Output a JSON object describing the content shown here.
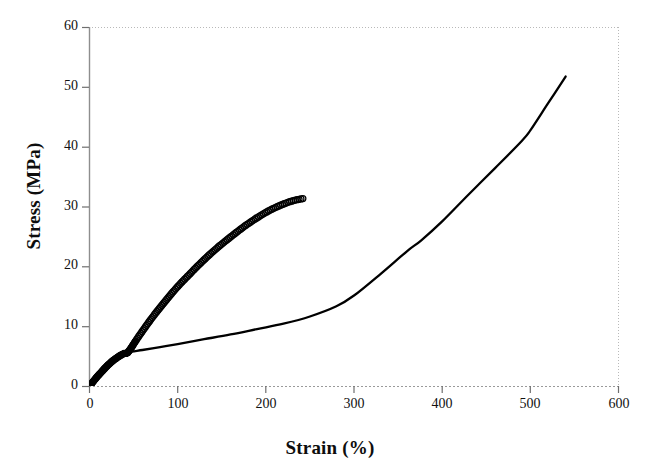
{
  "chart_data": {
    "type": "line",
    "title": "",
    "xlabel": "Strain (%)",
    "ylabel": "Stress (MPa)",
    "xlim": [
      0,
      600
    ],
    "ylim": [
      0,
      60
    ],
    "xticks": [
      0,
      100,
      200,
      300,
      400,
      500,
      600
    ],
    "yticks": [
      0,
      10,
      20,
      30,
      40,
      50,
      60
    ],
    "xtick_labels": [
      "0",
      "100",
      "200",
      "300",
      "400",
      "500",
      "600"
    ],
    "ytick_labels": [
      "0",
      "10",
      "20",
      "30",
      "40",
      "50",
      "60"
    ],
    "grid": false,
    "frame": "dotted-top-right",
    "legend": "none",
    "series": [
      {
        "name": "solid-curve",
        "marker": "none",
        "line_style": "solid",
        "color": "#000000",
        "x": [
          0,
          5,
          12,
          20,
          28,
          36,
          44,
          60,
          80,
          100,
          130,
          160,
          190,
          220,
          250,
          280,
          300,
          330,
          360,
          376,
          400,
          430,
          460,
          490,
          500,
          520,
          540
        ],
        "y": [
          0,
          0.9,
          2.1,
          3.2,
          4.3,
          5.1,
          5.7,
          6.1,
          6.6,
          7.1,
          7.9,
          8.7,
          9.6,
          10.5,
          11.7,
          13.4,
          15.2,
          18.8,
          22.6,
          24.4,
          27.6,
          32.1,
          36.5,
          41.0,
          42.8,
          47.3,
          51.8
        ]
      },
      {
        "name": "circle-marker-curve",
        "marker": "open-circle",
        "line_style": "dense-markers",
        "color": "#000000",
        "x": [
          0,
          4,
          9,
          14,
          19,
          24,
          29,
          34,
          39,
          44,
          55,
          70,
          85,
          100,
          115,
          130,
          145,
          160,
          175,
          190,
          205,
          220,
          232,
          242
        ],
        "y": [
          0,
          0.8,
          1.7,
          2.5,
          3.3,
          4.0,
          4.6,
          5.1,
          5.5,
          5.8,
          8.2,
          11.3,
          14.1,
          16.7,
          19.0,
          21.2,
          23.2,
          25.0,
          26.7,
          28.2,
          29.5,
          30.5,
          31.1,
          31.4
        ]
      }
    ],
    "annotations": [
      {
        "text": "dense overlapping marker cluster near origin",
        "x_range": [
          0,
          48
        ],
        "y_range": [
          0,
          6
        ]
      }
    ]
  },
  "axes": {
    "y_title": "Stress (MPa)",
    "x_title": "Strain (%)"
  }
}
